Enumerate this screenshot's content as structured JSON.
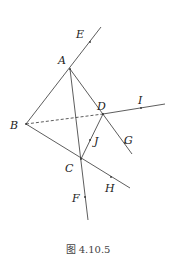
{
  "figure": {
    "caption": "图 4.10.5",
    "line_color": "#333333",
    "points": {
      "A": {
        "label": "A",
        "x": 70,
        "y": 69,
        "lx": 58,
        "ly": 64
      },
      "B": {
        "label": "B",
        "x": 26,
        "y": 124,
        "lx": 10,
        "ly": 129
      },
      "C": {
        "label": "C",
        "x": 81,
        "y": 159,
        "lx": 65,
        "ly": 172
      },
      "D": {
        "label": "D",
        "x": 103,
        "y": 114,
        "lx": 97,
        "ly": 110
      },
      "E": {
        "label": "E",
        "x": 90,
        "y": 42,
        "lx": 76,
        "ly": 38
      },
      "F": {
        "label": "F",
        "x": 85,
        "y": 197,
        "lx": 72,
        "ly": 202
      },
      "G": {
        "label": "G",
        "x": 125,
        "y": 143,
        "lx": 124,
        "ly": 144
      },
      "H": {
        "label": "H",
        "x": 111,
        "y": 177,
        "lx": 105,
        "ly": 192
      },
      "I": {
        "label": "I",
        "x": 141,
        "y": 108,
        "lx": 138,
        "ly": 104
      },
      "J": {
        "label": "J",
        "x": 90,
        "y": 140,
        "lx": 94,
        "ly": 145
      }
    },
    "segments": [
      {
        "name": "ray-A-E",
        "x1": 26,
        "y1": 124,
        "x2": 101,
        "y2": 27,
        "dashed": false
      },
      {
        "name": "segment-A-F",
        "x1": 70,
        "y1": 69,
        "x2": 88,
        "y2": 220,
        "dashed": false
      },
      {
        "name": "segment-A-G",
        "x1": 70,
        "y1": 69,
        "x2": 132,
        "y2": 154,
        "dashed": false
      },
      {
        "name": "segment-B-D",
        "x1": 26,
        "y1": 124,
        "x2": 103,
        "y2": 114,
        "dashed": true
      },
      {
        "name": "ray-D-I",
        "x1": 103,
        "y1": 114,
        "x2": 165,
        "y2": 104,
        "dashed": false
      },
      {
        "name": "segment-B-H",
        "x1": 26,
        "y1": 124,
        "x2": 130,
        "y2": 188,
        "dashed": false
      },
      {
        "name": "segment-C-D",
        "x1": 81,
        "y1": 159,
        "x2": 103,
        "y2": 114,
        "dashed": false
      }
    ]
  }
}
